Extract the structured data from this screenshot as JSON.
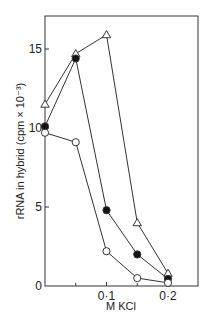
{
  "chart_data": {
    "type": "line",
    "title": "",
    "xlabel": "M KCl",
    "ylabel": "rRNA in hybrid (cpm × 10⁻³)",
    "xlim": [
      0,
      0.25
    ],
    "ylim": [
      0,
      17.5
    ],
    "x_ticks": [
      0.1,
      0.2
    ],
    "x_tick_labels": [
      "0·1",
      "0·2"
    ],
    "x_minor_ticks": [
      0.05,
      0.15
    ],
    "y_ticks": [
      0,
      5,
      10,
      15
    ],
    "y_tick_labels": [
      "0",
      "5",
      "10",
      "15"
    ],
    "grid": false,
    "legend": null,
    "series": [
      {
        "name": "open-triangle",
        "marker": "open-triangle",
        "x": [
          0,
          0.05,
          0.1,
          0.15,
          0.2
        ],
        "values": [
          11.5,
          14.7,
          15.9,
          4.0,
          0.8
        ]
      },
      {
        "name": "filled-circle",
        "marker": "filled-circle",
        "x": [
          0,
          0.05,
          0.1,
          0.15,
          0.2
        ],
        "values": [
          10.1,
          14.4,
          4.8,
          2.0,
          0.45
        ]
      },
      {
        "name": "open-circle",
        "marker": "open-circle",
        "x": [
          0,
          0.05,
          0.1,
          0.15,
          0.2
        ],
        "values": [
          9.7,
          9.1,
          2.2,
          0.5,
          0.2
        ]
      }
    ]
  },
  "colors": {
    "line": "#333333",
    "background": "#ffffff"
  }
}
